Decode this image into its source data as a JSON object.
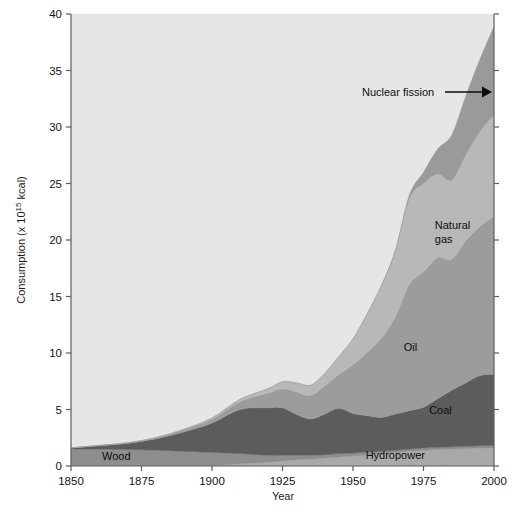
{
  "chart_data": {
    "type": "area",
    "stacked": true,
    "title": "",
    "subtitle": "",
    "xlabel": "Year",
    "ylabel": "Consumption (x 10^15 kcal)",
    "ylabel_parts": {
      "prefix": "Consumption (x 10",
      "exponent": "15",
      "suffix": " kcal)"
    },
    "xlim": [
      1850,
      2000
    ],
    "ylim": [
      0,
      40
    ],
    "grid": false,
    "legend_position": "inline-labels",
    "xticks": [
      1850,
      1875,
      1900,
      1925,
      1950,
      1975,
      2000
    ],
    "yticks": [
      0,
      5,
      10,
      15,
      20,
      25,
      30,
      35,
      40
    ],
    "x": [
      1850,
      1860,
      1870,
      1880,
      1890,
      1900,
      1910,
      1920,
      1925,
      1930,
      1935,
      1940,
      1945,
      1950,
      1955,
      1960,
      1965,
      1970,
      1975,
      1980,
      1985,
      1990,
      1995,
      2000
    ],
    "series": [
      {
        "name": "Hydropower",
        "label": "Hydropower",
        "color": "#a9a9a9",
        "values": [
          0.0,
          0.0,
          0.0,
          0.0,
          0.0,
          0.05,
          0.2,
          0.35,
          0.45,
          0.55,
          0.6,
          0.7,
          0.8,
          0.9,
          1.0,
          1.1,
          1.2,
          1.3,
          1.4,
          1.45,
          1.5,
          1.55,
          1.6,
          1.6
        ]
      },
      {
        "name": "Wood",
        "label": "Wood",
        "color": "#8e8e8e",
        "values": [
          1.5,
          1.5,
          1.45,
          1.4,
          1.3,
          1.15,
          0.9,
          0.6,
          0.5,
          0.4,
          0.35,
          0.3,
          0.3,
          0.25,
          0.25,
          0.2,
          0.2,
          0.2,
          0.2,
          0.2,
          0.2,
          0.2,
          0.2,
          0.2
        ]
      },
      {
        "name": "Coal",
        "label": "Coal",
        "color": "#5c5c5c",
        "values": [
          0.1,
          0.3,
          0.55,
          1.0,
          1.7,
          2.6,
          3.9,
          4.2,
          4.2,
          3.6,
          3.2,
          3.6,
          4.0,
          3.5,
          3.2,
          3.0,
          3.2,
          3.4,
          3.6,
          4.3,
          5.0,
          5.6,
          6.2,
          6.3
        ]
      },
      {
        "name": "Oil",
        "label": "Oil",
        "color": "#9c9c9c",
        "values": [
          0.0,
          0.02,
          0.05,
          0.1,
          0.2,
          0.35,
          0.7,
          1.3,
          1.7,
          2.0,
          2.1,
          2.5,
          3.0,
          4.3,
          5.6,
          7.0,
          8.6,
          11.2,
          12.0,
          12.5,
          11.6,
          12.6,
          13.2,
          14.0
        ]
      },
      {
        "name": "Natural gas",
        "label": "Natural gas",
        "color": "#b8b8b8",
        "values": [
          0.0,
          0.0,
          0.0,
          0.0,
          0.05,
          0.1,
          0.2,
          0.4,
          0.6,
          0.8,
          0.9,
          1.1,
          1.6,
          2.3,
          3.4,
          4.6,
          5.8,
          7.6,
          7.8,
          7.4,
          7.0,
          7.6,
          8.4,
          9.0
        ]
      },
      {
        "name": "Nuclear fission",
        "label": "Nuclear fission",
        "color": "#9a9a9a",
        "values": [
          0.0,
          0.0,
          0.0,
          0.0,
          0.0,
          0.0,
          0.0,
          0.0,
          0.0,
          0.0,
          0.0,
          0.0,
          0.0,
          0.0,
          0.0,
          0.05,
          0.1,
          0.3,
          1.0,
          2.2,
          4.0,
          5.2,
          6.4,
          7.8
        ]
      }
    ],
    "annotations": [
      {
        "text": "Nuclear fission",
        "type": "arrow-right",
        "x_year": 1985,
        "y_value": 33.5
      }
    ],
    "inline_labels": [
      {
        "text": "Wood",
        "x_year": 1861,
        "y_value": 0.55
      },
      {
        "text": "Hydropower",
        "x_year": 1965,
        "y_value": 0.6
      },
      {
        "text": "Coal",
        "x_year": 1977,
        "y_value": 4.6
      },
      {
        "text": "Oil",
        "x_year": 1968,
        "y_value": 10.2
      },
      {
        "text": "Natural gas",
        "x_year": 1979,
        "y_value": 21.0
      }
    ],
    "plot_background": "#e6e6e6"
  }
}
